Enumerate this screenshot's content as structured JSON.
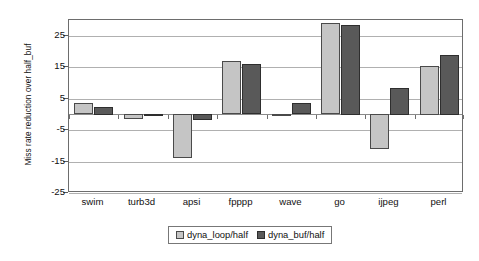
{
  "chart_data": {
    "type": "bar",
    "title": "",
    "subtitle": "",
    "xlabel": "",
    "ylabel": "Miss rate reduction over half_buf",
    "ylim": [
      -25,
      30
    ],
    "yticks": [
      25,
      15,
      5,
      -5,
      -15,
      -25
    ],
    "ytick_labels": [
      "25",
      "15",
      "5",
      "-5",
      "-15",
      "-25"
    ],
    "grid": true,
    "legend_position": "bottom-center",
    "categories": [
      "swim",
      "turb3d",
      "apsi",
      "fpppp",
      "wave",
      "go",
      "ijpeg",
      "perl"
    ],
    "series": [
      {
        "name": "dyna_loop/half",
        "color": "#c5c5c5",
        "values": [
          3.5,
          -1.5,
          -14.0,
          17.0,
          0.2,
          29.0,
          -11.0,
          15.5
        ]
      },
      {
        "name": "dyna_buf/half",
        "color": "#595959",
        "values": [
          2.5,
          -0.3,
          -2.0,
          16.0,
          3.5,
          28.5,
          8.5,
          19.0
        ]
      }
    ]
  },
  "axis": {
    "y_title": "Miss rate reduction over half_buf",
    "tick_labels": [
      "25",
      "15",
      "5",
      "-5",
      "-15",
      "-25"
    ],
    "category_labels": [
      "swim",
      "turb3d",
      "apsi",
      "fpppp",
      "wave",
      "go",
      "ijpeg",
      "perl"
    ]
  },
  "legend": {
    "entries": [
      {
        "label": "dyna_loop/half",
        "swatch": "light-gray-swatch-icon"
      },
      {
        "label": "dyna_buf/half",
        "swatch": "dark-gray-swatch-icon"
      }
    ]
  },
  "colors": {
    "series_light": "#c5c5c5",
    "series_dark": "#595959",
    "gridline": "#b0b0b0",
    "plot_border": "#6d6d6d",
    "text": "#111111",
    "background": "#ffffff"
  }
}
